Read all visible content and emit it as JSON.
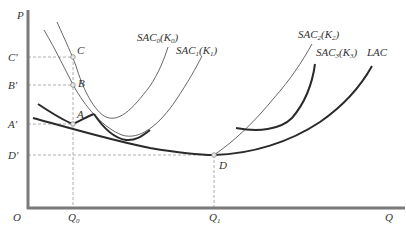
{
  "diagram": {
    "type": "economics-cost-curves",
    "axes": {
      "y_label": "P",
      "x_label": "Q",
      "origin_label": "O",
      "y_ticks": [
        {
          "id": "C_prime",
          "label": "C′",
          "y": 57
        },
        {
          "id": "B_prime",
          "label": "B′",
          "y": 85
        },
        {
          "id": "A_prime",
          "label": "A′",
          "y": 124
        },
        {
          "id": "D_prime",
          "label": "D′",
          "y": 155
        }
      ],
      "x_ticks": [
        {
          "id": "Q0",
          "base": "Q",
          "sub": "0",
          "x": 73
        },
        {
          "id": "Q1",
          "base": "Q",
          "sub": "1",
          "x": 214
        }
      ]
    },
    "points": [
      {
        "id": "C",
        "label": "C",
        "x": 73,
        "y": 57
      },
      {
        "id": "B",
        "label": "B",
        "x": 73,
        "y": 85
      },
      {
        "id": "A",
        "label": "A",
        "x": 73,
        "y": 124
      },
      {
        "id": "D",
        "label": "D",
        "x": 214,
        "y": 155
      }
    ],
    "curves": [
      {
        "id": "SAC0",
        "base": "SAC",
        "sub": "0",
        "arg_base": "K",
        "arg_sub": "0",
        "weight": "thin"
      },
      {
        "id": "SAC1",
        "base": "SAC",
        "sub": "1",
        "arg_base": "K",
        "arg_sub": "1",
        "weight": "thin"
      },
      {
        "id": "SAC2",
        "base": "SAC",
        "sub": "2",
        "arg_base": "K",
        "arg_sub": "2",
        "weight": "thin"
      },
      {
        "id": "SAC3",
        "base": "SAC",
        "sub": "3",
        "arg_base": "K",
        "arg_sub": "3",
        "weight": "thick"
      },
      {
        "id": "LAC",
        "label": "LAC",
        "weight": "thick"
      }
    ],
    "colors": {
      "axis": "#7a7a7a",
      "curve": "#2a2a2a",
      "thin_curve": "#555555",
      "guide": "#9a9a9a",
      "point_fill": "#e8e8e8",
      "text": "#333333"
    }
  }
}
